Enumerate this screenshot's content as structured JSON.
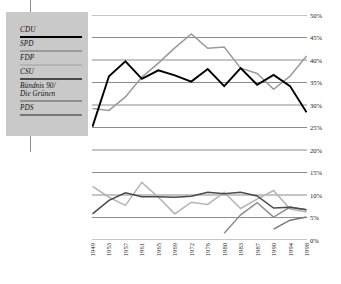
{
  "legend": {
    "items": [
      {
        "label": "CDU",
        "color": "#000000",
        "width": 2.1
      },
      {
        "label": "SPD",
        "color": "#9a9a9a",
        "width": 1.7
      },
      {
        "label": "FDP",
        "color": "#b4b4b4",
        "width": 1.7
      },
      {
        "label": "CSU",
        "color": "#4a4a4a",
        "width": 1.7
      },
      {
        "label": "Bündnis 90/\nDie Grünen",
        "line1": "Bündnis 90/",
        "line2": "Die Grünen",
        "color": "#8f8f8f",
        "width": 1.7
      },
      {
        "label": "PDS",
        "color": "#777777",
        "width": 1.7
      }
    ]
  },
  "axes": {
    "y_ticks": [
      "0%",
      "5%",
      "10%",
      "15%",
      "20%",
      "25%",
      "30%",
      "35%",
      "40%",
      "45%",
      "50%"
    ],
    "x_ticks": [
      "1949",
      "1953",
      "1957",
      "1961",
      "1965",
      "1969",
      "1972",
      "1976",
      "1980",
      "1983",
      "1987",
      "1990",
      "1994",
      "1998"
    ]
  },
  "chart_data": {
    "type": "line",
    "title": "",
    "subtitle": "",
    "xlabel": "",
    "ylabel": "",
    "ylim": [
      0,
      50
    ],
    "ytick_step": 5,
    "grid": "horizontal",
    "legend_position": "left-outside",
    "x": [
      "1949",
      "1953",
      "1957",
      "1961",
      "1965",
      "1969",
      "1972",
      "1976",
      "1980",
      "1983",
      "1987",
      "1990",
      "1994",
      "1998"
    ],
    "series": [
      {
        "name": "CDU",
        "color": "#000000",
        "values": [
          25.2,
          36.4,
          39.7,
          35.8,
          37.7,
          36.6,
          35.2,
          38.0,
          34.2,
          38.2,
          34.5,
          36.7,
          34.2,
          28.4
        ]
      },
      {
        "name": "SPD",
        "color": "#9a9a9a",
        "values": [
          29.2,
          28.8,
          31.8,
          36.2,
          39.3,
          42.7,
          45.8,
          42.6,
          42.9,
          38.2,
          37.0,
          33.5,
          36.4,
          40.9
        ]
      },
      {
        "name": "FDP",
        "color": "#b4b4b4",
        "values": [
          11.9,
          9.5,
          7.7,
          12.8,
          9.5,
          5.8,
          8.4,
          7.9,
          10.6,
          7.0,
          9.1,
          11.0,
          6.9,
          6.2
        ]
      },
      {
        "name": "CSU",
        "color": "#4a4a4a",
        "values": [
          5.8,
          8.8,
          10.5,
          9.6,
          9.6,
          9.5,
          9.7,
          10.6,
          10.3,
          10.6,
          9.8,
          7.1,
          7.3,
          6.7
        ]
      },
      {
        "name": "Bündnis 90/Die Grünen",
        "color": "#8f8f8f",
        "values": [
          null,
          null,
          null,
          null,
          null,
          null,
          null,
          null,
          1.5,
          5.6,
          8.3,
          5.1,
          7.3,
          6.7
        ]
      },
      {
        "name": "PDS",
        "color": "#777777",
        "values": [
          null,
          null,
          null,
          null,
          null,
          null,
          null,
          null,
          null,
          null,
          null,
          2.4,
          4.4,
          5.1
        ]
      }
    ]
  }
}
